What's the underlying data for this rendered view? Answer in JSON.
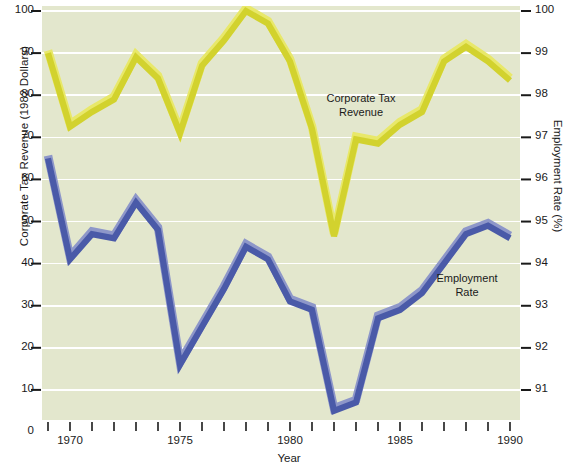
{
  "chart_data": {
    "type": "line",
    "title": "",
    "xlabel": "Year",
    "ylabel_left": "Corporate Tax Revenue (1982 Dollars)",
    "ylabel_right": "Employment Rate (%)",
    "grid": true,
    "legend_position": "inline-annotations",
    "plot_background": "#e3e7cd",
    "x": [
      1969,
      1970,
      1971,
      1972,
      1973,
      1974,
      1975,
      1976,
      1977,
      1978,
      1979,
      1980,
      1981,
      1982,
      1983,
      1984,
      1985,
      1986,
      1987,
      1988,
      1989,
      1990
    ],
    "xlim": [
      1968.5,
      1990.6
    ],
    "xticks": [
      1969,
      1970,
      1971,
      1972,
      1973,
      1974,
      1975,
      1976,
      1977,
      1978,
      1979,
      1980,
      1981,
      1982,
      1983,
      1984,
      1985,
      1986,
      1987,
      1988,
      1989,
      1990
    ],
    "xtick_labels_shown": [
      "1970",
      "1975",
      "1980",
      "1985",
      "1990"
    ],
    "left_axis": {
      "label": "Corporate Tax Revenue (1982 Dollars)",
      "ylim": [
        0,
        100
      ],
      "ticks": [
        0,
        10,
        20,
        30,
        40,
        50,
        60,
        70,
        80,
        90,
        100
      ],
      "tick_labels": [
        "0",
        "10",
        "20",
        "30",
        "40",
        "50",
        "60",
        "70",
        "80",
        "90",
        "100"
      ]
    },
    "right_axis": {
      "label": "Employment Rate (%)",
      "ylim": [
        90.0,
        100.0
      ],
      "ticks": [
        91,
        92,
        93,
        94,
        95,
        96,
        97,
        98,
        99,
        100
      ],
      "tick_labels": [
        "91",
        "92",
        "93",
        "94",
        "95",
        "96",
        "97",
        "98",
        "99",
        "100"
      ]
    },
    "series": [
      {
        "name": "Corporate Tax Revenue",
        "axis": "left",
        "color": "#d2d22e",
        "highlight_color": "#e8e86a",
        "annotation": "Corporate Tax\nRevenue",
        "annotation_line1": "Corporate Tax",
        "annotation_line2": "Revenue",
        "values": [
          90,
          72.5,
          76,
          79,
          89,
          84,
          71,
          87,
          93,
          100,
          97,
          88,
          72,
          46.5,
          69.5,
          68.5,
          73,
          76,
          88,
          91.5,
          88,
          83.5
        ]
      },
      {
        "name": "Employment Rate",
        "axis": "right",
        "color": "#4a5aa8",
        "highlight_color": "#8e97c9",
        "annotation": "Employment\nRate",
        "annotation_line1": "Employment",
        "annotation_line2": "Rate",
        "values_left_scale": [
          65,
          41,
          47,
          46,
          54.5,
          48,
          16,
          25,
          34,
          44,
          41,
          31,
          29,
          5,
          7,
          27,
          29,
          33,
          40,
          47,
          49,
          46
        ],
        "values": [
          96.5,
          94.1,
          94.7,
          94.6,
          95.45,
          94.8,
          91.6,
          92.5,
          93.4,
          94.4,
          94.1,
          93.1,
          92.9,
          90.5,
          90.7,
          92.7,
          92.9,
          93.3,
          94.0,
          94.7,
          94.9,
          94.6
        ]
      }
    ]
  },
  "axes": {
    "left_title": "Corporate Tax Revenue (1982 Dollars)",
    "right_title": "Employment Rate (%)",
    "bottom_title": "Year"
  },
  "annotations": {
    "yellow_line1": "Corporate Tax",
    "yellow_line2": "Revenue",
    "blue_line1": "Employment",
    "blue_line2": "Rate"
  }
}
